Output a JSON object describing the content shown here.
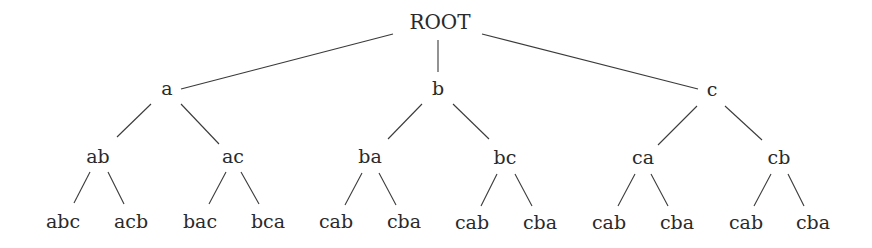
{
  "diagram": {
    "type": "tree",
    "root": "n0",
    "nodes": [
      {
        "id": "n0",
        "label": "ROOT",
        "x": 440,
        "y": 22,
        "level": 0
      },
      {
        "id": "n1",
        "label": "a",
        "x": 167,
        "y": 88,
        "level": 1
      },
      {
        "id": "n2",
        "label": "b",
        "x": 438,
        "y": 88,
        "level": 1
      },
      {
        "id": "n3",
        "label": "c",
        "x": 712,
        "y": 89,
        "level": 1
      },
      {
        "id": "n4",
        "label": "ab",
        "x": 98,
        "y": 156,
        "level": 2
      },
      {
        "id": "n5",
        "label": "ac",
        "x": 233,
        "y": 156,
        "level": 2
      },
      {
        "id": "n6",
        "label": "ba",
        "x": 370,
        "y": 156,
        "level": 2
      },
      {
        "id": "n7",
        "label": "bc",
        "x": 505,
        "y": 157,
        "level": 2
      },
      {
        "id": "n8",
        "label": "ca",
        "x": 643,
        "y": 157,
        "level": 2
      },
      {
        "id": "n9",
        "label": "cb",
        "x": 779,
        "y": 157,
        "level": 2
      },
      {
        "id": "n10",
        "label": "abc",
        "x": 63,
        "y": 221,
        "level": 3
      },
      {
        "id": "n11",
        "label": "acb",
        "x": 131,
        "y": 221,
        "level": 3
      },
      {
        "id": "n12",
        "label": "bac",
        "x": 200,
        "y": 221,
        "level": 3
      },
      {
        "id": "n13",
        "label": "bca",
        "x": 268,
        "y": 221,
        "level": 3
      },
      {
        "id": "n14",
        "label": "cab",
        "x": 336,
        "y": 221,
        "level": 3
      },
      {
        "id": "n15",
        "label": "cba",
        "x": 404,
        "y": 221,
        "level": 3
      },
      {
        "id": "n16",
        "label": "cab",
        "x": 472,
        "y": 222,
        "level": 3
      },
      {
        "id": "n17",
        "label": "cba",
        "x": 540,
        "y": 222,
        "level": 3
      },
      {
        "id": "n18",
        "label": "cab",
        "x": 609,
        "y": 222,
        "level": 3
      },
      {
        "id": "n19",
        "label": "cba",
        "x": 677,
        "y": 222,
        "level": 3
      },
      {
        "id": "n20",
        "label": "cab",
        "x": 746,
        "y": 222,
        "level": 3
      },
      {
        "id": "n21",
        "label": "cba",
        "x": 813,
        "y": 222,
        "level": 3
      }
    ],
    "edges": [
      {
        "from": "n0",
        "to": "n1",
        "x1": 393,
        "y1": 34,
        "x2": 181,
        "y2": 89
      },
      {
        "from": "n0",
        "to": "n2",
        "x1": 438,
        "y1": 40,
        "x2": 438,
        "y2": 72
      },
      {
        "from": "n0",
        "to": "n3",
        "x1": 482,
        "y1": 34,
        "x2": 698,
        "y2": 89
      },
      {
        "from": "n1",
        "to": "n4",
        "x1": 151,
        "y1": 104,
        "x2": 117,
        "y2": 137
      },
      {
        "from": "n1",
        "to": "n5",
        "x1": 181,
        "y1": 104,
        "x2": 219,
        "y2": 144
      },
      {
        "from": "n2",
        "to": "n6",
        "x1": 422,
        "y1": 104,
        "x2": 388,
        "y2": 139
      },
      {
        "from": "n2",
        "to": "n7",
        "x1": 453,
        "y1": 104,
        "x2": 489,
        "y2": 139
      },
      {
        "from": "n3",
        "to": "n8",
        "x1": 697,
        "y1": 106,
        "x2": 658,
        "y2": 145
      },
      {
        "from": "n3",
        "to": "n9",
        "x1": 725,
        "y1": 106,
        "x2": 762,
        "y2": 140
      },
      {
        "from": "n4",
        "to": "n10",
        "x1": 90,
        "y1": 172,
        "x2": 74,
        "y2": 203
      },
      {
        "from": "n4",
        "to": "n11",
        "x1": 108,
        "y1": 172,
        "x2": 124,
        "y2": 204
      },
      {
        "from": "n5",
        "to": "n12",
        "x1": 226,
        "y1": 172,
        "x2": 209,
        "y2": 204
      },
      {
        "from": "n5",
        "to": "n13",
        "x1": 241,
        "y1": 172,
        "x2": 259,
        "y2": 204
      },
      {
        "from": "n6",
        "to": "n14",
        "x1": 362,
        "y1": 173,
        "x2": 345,
        "y2": 205
      },
      {
        "from": "n6",
        "to": "n15",
        "x1": 379,
        "y1": 173,
        "x2": 396,
        "y2": 205
      },
      {
        "from": "n7",
        "to": "n16",
        "x1": 497,
        "y1": 174,
        "x2": 481,
        "y2": 206
      },
      {
        "from": "n7",
        "to": "n17",
        "x1": 515,
        "y1": 174,
        "x2": 532,
        "y2": 206
      },
      {
        "from": "n8",
        "to": "n18",
        "x1": 635,
        "y1": 174,
        "x2": 618,
        "y2": 206
      },
      {
        "from": "n8",
        "to": "n19",
        "x1": 651,
        "y1": 174,
        "x2": 668,
        "y2": 206
      },
      {
        "from": "n9",
        "to": "n20",
        "x1": 771,
        "y1": 174,
        "x2": 754,
        "y2": 206
      },
      {
        "from": "n9",
        "to": "n21",
        "x1": 788,
        "y1": 174,
        "x2": 804,
        "y2": 206
      }
    ]
  },
  "colors": {
    "background": "#ffffff",
    "text": "#2a2a2a",
    "edge": "#3a3a3a"
  }
}
